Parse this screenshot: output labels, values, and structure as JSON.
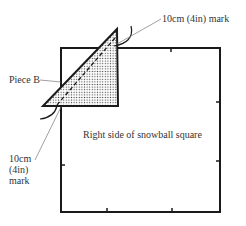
{
  "diagram": {
    "labels": {
      "top_mark": "10cm (4in) mark",
      "piece": "Piece B",
      "square": "Right side of snowball square",
      "bottom_mark_line1": "10cm",
      "bottom_mark_line2": "(4in)",
      "bottom_mark_line3": "mark"
    },
    "colors": {
      "stroke": "#1a1a1a",
      "leader": "#777777",
      "dots": "#444444",
      "background": "#ffffff"
    }
  }
}
